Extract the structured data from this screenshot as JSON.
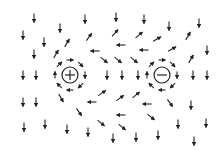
{
  "diagram": {
    "title": "",
    "colors": {
      "arrow": "#222222",
      "background": "#ffffff"
    },
    "charges": [
      {
        "name": "positive-charge",
        "symbol": "+",
        "x": 70,
        "y": 75,
        "r": 8
      },
      {
        "name": "negative-charge",
        "symbol": "−",
        "x": 162,
        "y": 75,
        "r": 8
      }
    ],
    "arrows": [
      {
        "x": 34,
        "y": 18,
        "a": 90
      },
      {
        "x": 60,
        "y": 28,
        "a": 90
      },
      {
        "x": 85,
        "y": 19,
        "a": 90
      },
      {
        "x": 116,
        "y": 17,
        "a": 90
      },
      {
        "x": 144,
        "y": 19,
        "a": 90
      },
      {
        "x": 169,
        "y": 26,
        "a": 90
      },
      {
        "x": 199,
        "y": 23,
        "a": 90
      },
      {
        "x": 23,
        "y": 35,
        "a": 90
      },
      {
        "x": 44,
        "y": 42,
        "a": 90
      },
      {
        "x": 67,
        "y": 43,
        "a": -60
      },
      {
        "x": 89,
        "y": 37,
        "a": -55
      },
      {
        "x": 115,
        "y": 33,
        "a": -50
      },
      {
        "x": 139,
        "y": 35,
        "a": -40
      },
      {
        "x": 157,
        "y": 39,
        "a": -30
      },
      {
        "x": 188,
        "y": 36,
        "a": -60
      },
      {
        "x": 34,
        "y": 54,
        "a": 90
      },
      {
        "x": 56,
        "y": 54,
        "a": -60
      },
      {
        "x": 95,
        "y": 51,
        "a": 180
      },
      {
        "x": 121,
        "y": 45,
        "a": 180
      },
      {
        "x": 144,
        "y": 50,
        "a": 180
      },
      {
        "x": 172,
        "y": 49,
        "a": -30
      },
      {
        "x": 207,
        "y": 50,
        "a": 90
      },
      {
        "x": 104,
        "y": 60,
        "a": 40
      },
      {
        "x": 118,
        "y": 60,
        "a": 40
      },
      {
        "x": 134,
        "y": 60,
        "a": 40
      },
      {
        "x": 191,
        "y": 59,
        "a": -60
      },
      {
        "x": 23,
        "y": 75,
        "a": 90
      },
      {
        "x": 36,
        "y": 75,
        "a": 90
      },
      {
        "x": 107,
        "y": 75,
        "a": 90
      },
      {
        "x": 122,
        "y": 75,
        "a": 90
      },
      {
        "x": 138,
        "y": 75,
        "a": 90
      },
      {
        "x": 193,
        "y": 75,
        "a": 90
      },
      {
        "x": 207,
        "y": 75,
        "a": 90
      },
      {
        "x": 23,
        "y": 102,
        "a": 90
      },
      {
        "x": 36,
        "y": 102,
        "a": 90
      },
      {
        "x": 61,
        "y": 98,
        "a": 60
      },
      {
        "x": 92,
        "y": 102,
        "a": 180
      },
      {
        "x": 102,
        "y": 93,
        "a": -35
      },
      {
        "x": 120,
        "y": 98,
        "a": -35
      },
      {
        "x": 136,
        "y": 95,
        "a": -40
      },
      {
        "x": 147,
        "y": 104,
        "a": 180
      },
      {
        "x": 170,
        "y": 103,
        "a": 55
      },
      {
        "x": 191,
        "y": 105,
        "a": 90
      },
      {
        "x": 79,
        "y": 112,
        "a": 55
      },
      {
        "x": 121,
        "y": 115,
        "a": 180
      },
      {
        "x": 151,
        "y": 117,
        "a": 40
      },
      {
        "x": 24,
        "y": 127,
        "a": 90
      },
      {
        "x": 45,
        "y": 124,
        "a": 90
      },
      {
        "x": 67,
        "y": 129,
        "a": 90
      },
      {
        "x": 88,
        "y": 132,
        "a": 90
      },
      {
        "x": 101,
        "y": 123,
        "a": 40
      },
      {
        "x": 122,
        "y": 127,
        "a": 40
      },
      {
        "x": 113,
        "y": 138,
        "a": 90
      },
      {
        "x": 136,
        "y": 137,
        "a": 90
      },
      {
        "x": 158,
        "y": 135,
        "a": 90
      },
      {
        "x": 178,
        "y": 124,
        "a": 90
      },
      {
        "x": 206,
        "y": 123,
        "a": 90
      },
      {
        "x": 194,
        "y": 141,
        "a": 90
      }
    ],
    "ring_arrows_positive": [
      {
        "a": -90
      },
      {
        "a": -45
      },
      {
        "a": 0
      },
      {
        "a": 45
      },
      {
        "a": 90
      },
      {
        "a": 135
      },
      {
        "a": 180
      },
      {
        "a": 225
      }
    ],
    "ring_arrows_negative": [
      {
        "a": -90
      },
      {
        "a": -45
      },
      {
        "a": 0
      },
      {
        "a": 45
      },
      {
        "a": 90
      },
      {
        "a": 135
      },
      {
        "a": 180
      },
      {
        "a": 225
      }
    ]
  }
}
